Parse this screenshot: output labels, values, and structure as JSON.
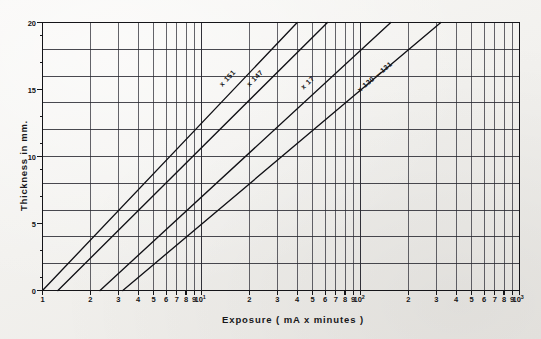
{
  "figure": {
    "background_color": "#f2f1ee",
    "ink_color": "#17171a"
  },
  "axes": {
    "x": {
      "title": "Exposure ( mA x minutes )",
      "scale": "log",
      "range": [
        1,
        1000
      ],
      "tick_labels": [
        {
          "value": 1,
          "text": "1"
        },
        {
          "value": 2,
          "text": "2"
        },
        {
          "value": 3,
          "text": "3"
        },
        {
          "value": 4,
          "text": "4"
        },
        {
          "value": 5,
          "text": "5"
        },
        {
          "value": 6,
          "text": "6"
        },
        {
          "value": 7,
          "text": "7"
        },
        {
          "value": 8,
          "text": "8"
        },
        {
          "value": 9,
          "text": "9"
        },
        {
          "value": 10,
          "text": "10",
          "exponent": "1"
        },
        {
          "value": 20,
          "text": "2"
        },
        {
          "value": 30,
          "text": "3"
        },
        {
          "value": 40,
          "text": "4"
        },
        {
          "value": 50,
          "text": "5"
        },
        {
          "value": 60,
          "text": "6"
        },
        {
          "value": 70,
          "text": "7"
        },
        {
          "value": 80,
          "text": "8"
        },
        {
          "value": 90,
          "text": "9"
        },
        {
          "value": 100,
          "text": "10",
          "exponent": "2"
        },
        {
          "value": 200,
          "text": "2"
        },
        {
          "value": 300,
          "text": "3"
        },
        {
          "value": 400,
          "text": "4"
        },
        {
          "value": 500,
          "text": "5"
        },
        {
          "value": 600,
          "text": "6"
        },
        {
          "value": 700,
          "text": "7"
        },
        {
          "value": 800,
          "text": "8"
        },
        {
          "value": 900,
          "text": "9"
        },
        {
          "value": 1000,
          "text": "10",
          "exponent": "3"
        }
      ]
    },
    "y": {
      "title": "Thickness in mm.",
      "scale": "linear",
      "range": [
        0,
        20
      ],
      "major_tick_labels": [
        "0",
        "5",
        "10",
        "15",
        "20"
      ],
      "major_tick_values": [
        0,
        5,
        10,
        15,
        20
      ],
      "gridline_values": [
        0,
        2,
        4,
        6,
        8,
        10,
        12,
        14,
        16,
        18,
        20
      ],
      "minor_tick_values": [
        1,
        3,
        5,
        7,
        9,
        11,
        13,
        15,
        17,
        19
      ]
    }
  },
  "chart_data": {
    "type": "line",
    "title": "",
    "xlabel": "Exposure ( mA x minutes )",
    "ylabel": "Thickness in mm.",
    "xscale": "log",
    "yscale": "linear",
    "xlim": [
      1,
      1000
    ],
    "ylim": [
      0,
      20
    ],
    "grid": true,
    "legend": "inline-labels",
    "series": [
      {
        "name": "x 151",
        "label": "x 151",
        "label_x": 14.5,
        "label_y": 15.1,
        "points": [
          {
            "x": 1.0,
            "y": 0
          },
          {
            "x": 10,
            "y": 9.6
          },
          {
            "x": 40,
            "y": 20
          }
        ]
      },
      {
        "name": "x 147",
        "label": "x 147",
        "label_x": 21.5,
        "label_y": 15.1,
        "points": [
          {
            "x": 1.25,
            "y": 0
          },
          {
            "x": 10,
            "y": 8.6
          },
          {
            "x": 62,
            "y": 20
          }
        ]
      },
      {
        "name": "x 17",
        "label": "x 17",
        "label_x": 47,
        "label_y": 14.9,
        "points": [
          {
            "x": 2.3,
            "y": 0
          },
          {
            "x": 10,
            "y": 6.0
          },
          {
            "x": 155,
            "y": 20
          }
        ]
      },
      {
        "name": "x 130 —131",
        "label": "x 130 —131",
        "label_x": 105,
        "label_y": 14.7,
        "points": [
          {
            "x": 3.2,
            "y": 0
          },
          {
            "x": 10,
            "y": 4.6
          },
          {
            "x": 320,
            "y": 20
          }
        ]
      }
    ]
  }
}
